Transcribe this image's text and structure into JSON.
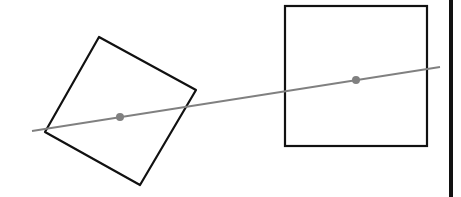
{
  "diagram": {
    "colors": {
      "background": "#ffffff",
      "outline": "#111111",
      "line": "#808080",
      "dot": "#808080",
      "border": "#111111"
    },
    "shapes": [
      {
        "name": "rotated-square",
        "points": "99,37 196,90 140,185 45,132"
      },
      {
        "name": "upright-square",
        "x": 285,
        "y": 6,
        "width": 142,
        "height": 140
      }
    ],
    "connector": {
      "x1": 32,
      "y1": 131,
      "x2": 440,
      "y2": 67
    },
    "centers": [
      {
        "name": "rotated-square-center",
        "cx": 120,
        "cy": 117
      },
      {
        "name": "upright-square-center",
        "cx": 356,
        "cy": 80
      }
    ]
  }
}
